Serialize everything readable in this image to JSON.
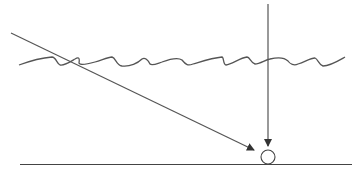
{
  "diagram": {
    "width": 359,
    "height": 171,
    "background": "#ffffff",
    "stroke_color": "#555555",
    "elements": {
      "wave_surface": {
        "type": "wavy-line",
        "from": [
          19,
          65
        ],
        "to": [
          345,
          57
        ]
      },
      "diagonal_ray": {
        "type": "arrow",
        "from": [
          11,
          33
        ],
        "to": [
          255,
          150
        ]
      },
      "vertical_ray": {
        "type": "arrow",
        "from": [
          268,
          4
        ],
        "to": [
          268,
          145
        ]
      },
      "target_circle": {
        "type": "circle",
        "cx": 268,
        "cy": 157,
        "r": 7
      },
      "ground_line": {
        "type": "line",
        "from": [
          20,
          164
        ],
        "to": [
          352,
          164
        ]
      }
    }
  }
}
